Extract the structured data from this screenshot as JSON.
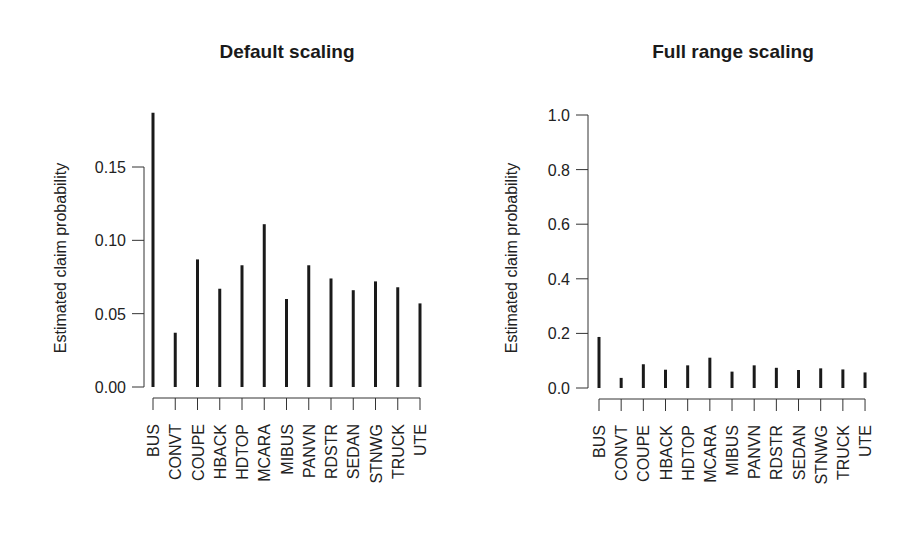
{
  "chart_data": [
    {
      "type": "bar",
      "subtype": "spike",
      "title": "Default scaling",
      "xlabel": "",
      "ylabel": "Estimated claim probability",
      "categories": [
        "BUS",
        "CONVT",
        "COUPE",
        "HBACK",
        "HDTOP",
        "MCARA",
        "MIBUS",
        "PANVN",
        "RDSTR",
        "SEDAN",
        "STNWG",
        "TRUCK",
        "UTE"
      ],
      "values": [
        0.187,
        0.037,
        0.087,
        0.067,
        0.083,
        0.111,
        0.06,
        0.083,
        0.074,
        0.066,
        0.072,
        0.068,
        0.057
      ],
      "ylim": [
        0,
        0.187
      ],
      "yticks": [
        0.0,
        0.05,
        0.1,
        0.15
      ],
      "ytick_labels": [
        "0.00",
        "0.05",
        "0.10",
        "0.15"
      ],
      "grid": false,
      "legend": null,
      "x_label_rotation": 90
    },
    {
      "type": "bar",
      "subtype": "spike",
      "title": "Full range scaling",
      "xlabel": "",
      "ylabel": "Estimated claim probability",
      "categories": [
        "BUS",
        "CONVT",
        "COUPE",
        "HBACK",
        "HDTOP",
        "MCARA",
        "MIBUS",
        "PANVN",
        "RDSTR",
        "SEDAN",
        "STNWG",
        "TRUCK",
        "UTE"
      ],
      "values": [
        0.187,
        0.037,
        0.087,
        0.067,
        0.083,
        0.111,
        0.06,
        0.083,
        0.074,
        0.066,
        0.072,
        0.068,
        0.057
      ],
      "ylim": [
        0,
        1.0
      ],
      "yticks": [
        0.0,
        0.2,
        0.4,
        0.6,
        0.8,
        1.0
      ],
      "ytick_labels": [
        "0.0",
        "0.2",
        "0.4",
        "0.6",
        "0.8",
        "1.0"
      ],
      "grid": false,
      "legend": null,
      "x_label_rotation": 90
    }
  ],
  "colors": {
    "bar": "#1a1a1a",
    "axis": "#333333",
    "text": "#222222",
    "background": "#ffffff"
  }
}
